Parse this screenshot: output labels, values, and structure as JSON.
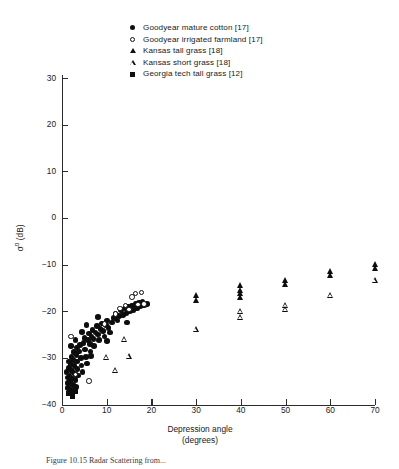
{
  "figure": {
    "caption": "Figure 10.15   Radar Scattering from..."
  },
  "legend": {
    "position": "top-center",
    "items": [
      {
        "marker": "filled-circle",
        "marker_class": "m-fc",
        "label": "Goodyear mature cotton [17]"
      },
      {
        "marker": "open-circle",
        "marker_class": "m-oc",
        "label": "Goodyear irrigated farmland [17]"
      },
      {
        "marker": "filled-triangle",
        "marker_class": "m-ft",
        "label": "Kansas tall grass [18]"
      },
      {
        "marker": "open-triangle",
        "marker_class": "m-ot",
        "label": "Kansas short grass [18]"
      },
      {
        "marker": "filled-square",
        "marker_class": "m-fs",
        "label": "Georgia tech tall grass [12]"
      }
    ]
  },
  "axes": {
    "y_title_main": "σ",
    "y_title_sup": "o",
    "y_title_unit": " (dB)",
    "x_title_line1": "Depression angle",
    "x_title_line2": "(degrees)",
    "y_ticks": [
      "30",
      "20",
      "10",
      "0",
      "-10",
      "-20",
      "-30",
      "-40"
    ],
    "x_ticks": [
      "0",
      "10",
      "20",
      "30",
      "40",
      "50",
      "60",
      "70"
    ]
  },
  "chart_data": {
    "type": "scatter",
    "title": "",
    "xlabel": "Depression angle (degrees)",
    "ylabel": "σ° (dB)",
    "xlim": [
      0,
      70
    ],
    "ylim": [
      -40,
      30
    ],
    "xtick_step": 10,
    "ytick_step": 10,
    "grid": false,
    "legend_position": "top-center",
    "series": [
      {
        "name": "Goodyear mature cotton [17]",
        "marker": "filled-circle",
        "reference": "17",
        "points": [
          [
            1.0,
            -33.0
          ],
          [
            1.2,
            -34.2
          ],
          [
            1.3,
            -35.4
          ],
          [
            1.4,
            -36.4
          ],
          [
            1.5,
            -32.2
          ],
          [
            1.6,
            -30.8
          ],
          [
            1.7,
            -33.8
          ],
          [
            1.8,
            -35.0
          ],
          [
            1.9,
            -36.8
          ],
          [
            2.0,
            -31.4
          ],
          [
            2.1,
            -29.8
          ],
          [
            2.2,
            -32.8
          ],
          [
            2.3,
            -34.4
          ],
          [
            2.4,
            -35.8
          ],
          [
            2.5,
            -37.0
          ],
          [
            2.6,
            -30.4
          ],
          [
            2.7,
            -28.8
          ],
          [
            2.8,
            -31.8
          ],
          [
            2.9,
            -33.4
          ],
          [
            3.0,
            -34.8
          ],
          [
            3.1,
            -36.2
          ],
          [
            3.2,
            -29.4
          ],
          [
            3.3,
            -27.8
          ],
          [
            3.4,
            -30.8
          ],
          [
            3.5,
            -32.4
          ],
          [
            3.6,
            -33.8
          ],
          [
            3.8,
            -28.6
          ],
          [
            4.0,
            -27.2
          ],
          [
            4.2,
            -30.0
          ],
          [
            4.4,
            -31.6
          ],
          [
            4.6,
            -33.0
          ],
          [
            4.8,
            -26.8
          ],
          [
            5.0,
            -25.8
          ],
          [
            5.2,
            -28.2
          ],
          [
            5.4,
            -29.8
          ],
          [
            5.6,
            -31.2
          ],
          [
            5.8,
            -26.2
          ],
          [
            6.0,
            -24.8
          ],
          [
            6.2,
            -27.0
          ],
          [
            6.4,
            -28.6
          ],
          [
            6.6,
            -25.4
          ],
          [
            6.8,
            -24.0
          ],
          [
            7.0,
            -26.0
          ],
          [
            7.2,
            -27.4
          ],
          [
            7.5,
            -24.6
          ],
          [
            7.8,
            -23.2
          ],
          [
            8.0,
            -25.0
          ],
          [
            8.3,
            -26.2
          ],
          [
            8.6,
            -23.8
          ],
          [
            8.9,
            -22.6
          ],
          [
            9.2,
            -24.2
          ],
          [
            9.5,
            -25.4
          ],
          [
            9.8,
            -23.0
          ],
          [
            10.1,
            -22.0
          ],
          [
            10.4,
            -23.6
          ],
          [
            10.8,
            -24.6
          ],
          [
            11.2,
            -22.4
          ],
          [
            11.6,
            -21.4
          ],
          [
            12.0,
            -20.6
          ],
          [
            12.4,
            -22.0
          ],
          [
            12.8,
            -21.0
          ],
          [
            13.2,
            -19.8
          ],
          [
            13.6,
            -20.8
          ],
          [
            14.0,
            -19.4
          ],
          [
            14.4,
            -20.4
          ],
          [
            14.8,
            -19.0
          ],
          [
            15.2,
            -20.0
          ],
          [
            15.6,
            -18.8
          ],
          [
            16.0,
            -19.8
          ],
          [
            16.4,
            -18.4
          ],
          [
            16.8,
            -19.4
          ],
          [
            17.2,
            -18.2
          ],
          [
            17.6,
            -19.0
          ],
          [
            18.0,
            -18.0
          ],
          [
            18.4,
            -18.8
          ],
          [
            19.0,
            -18.4
          ],
          [
            14.6,
            -22.4
          ],
          [
            10.0,
            -26.4
          ],
          [
            6.5,
            -29.6
          ],
          [
            4.5,
            -24.4
          ],
          [
            3.0,
            -26.2
          ],
          [
            2.0,
            -27.4
          ],
          [
            5.5,
            -23.0
          ],
          [
            8.0,
            -21.2
          ]
        ]
      },
      {
        "name": "Goodyear irrigated farmland [17]",
        "marker": "open-circle",
        "reference": "17",
        "points": [
          [
            2.0,
            -25.4
          ],
          [
            3.0,
            -33.6
          ],
          [
            6.0,
            -35.0
          ],
          [
            9.5,
            -22.8
          ],
          [
            12.0,
            -20.6
          ],
          [
            14.2,
            -18.8
          ],
          [
            15.0,
            -19.6
          ],
          [
            15.6,
            -17.0
          ],
          [
            16.4,
            -16.2
          ],
          [
            17.0,
            -18.6
          ],
          [
            17.8,
            -16.0
          ],
          [
            18.4,
            -18.4
          ],
          [
            13.0,
            -19.4
          ]
        ]
      },
      {
        "name": "Kansas tall grass [18]",
        "marker": "filled-triangle",
        "reference": "18",
        "points": [
          [
            30.0,
            -16.6
          ],
          [
            30.0,
            -17.6
          ],
          [
            40.0,
            -14.4
          ],
          [
            40.0,
            -15.4
          ],
          [
            40.0,
            -16.2
          ],
          [
            40.0,
            -17.0
          ],
          [
            50.0,
            -13.4
          ],
          [
            50.0,
            -14.2
          ],
          [
            60.0,
            -11.4
          ],
          [
            60.0,
            -12.2
          ],
          [
            70.0,
            -9.8
          ],
          [
            70.0,
            -10.8
          ]
        ]
      },
      {
        "name": "Kansas short grass [18]",
        "marker": "open-triangle",
        "reference": "18",
        "points": [
          [
            10.0,
            -29.8
          ],
          [
            12.0,
            -32.6
          ],
          [
            14.0,
            -26.0
          ],
          [
            15.0,
            -29.6
          ],
          [
            30.0,
            -23.8
          ],
          [
            40.0,
            -20.0
          ],
          [
            40.0,
            -21.2
          ],
          [
            50.0,
            -18.6
          ],
          [
            50.0,
            -19.6
          ],
          [
            60.0,
            -16.6
          ],
          [
            70.0,
            -13.4
          ]
        ]
      },
      {
        "name": "Georgia tech tall grass [12]",
        "marker": "filled-square",
        "reference": "12",
        "points": [
          [
            1.6,
            -37.6
          ],
          [
            2.4,
            -38.2
          ],
          [
            3.0,
            -37.2
          ]
        ]
      }
    ]
  }
}
